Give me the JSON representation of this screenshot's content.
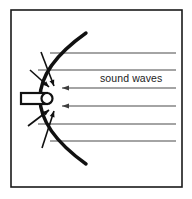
{
  "figure": {
    "background_color": "#ffffff",
    "frame": {
      "name": "outer-frame",
      "x": 11,
      "y": 10,
      "width": 171,
      "height": 177,
      "stroke_color": "#1a1a1a",
      "stroke_width": 1.6,
      "fill": "#ffffff"
    },
    "reflector": {
      "name": "parabolic-reflector",
      "description": "thick parabolic arc opening to the right",
      "vertex_x": 28,
      "vertex_y": 98,
      "top_end_x": 86,
      "top_end_y": 33,
      "bottom_end_x": 86,
      "bottom_end_y": 164,
      "stroke_color": "#111111",
      "stroke_width": 3.4
    },
    "microphone": {
      "name": "microphone-capsule",
      "description": "tube with rounded cap at the parabola focus",
      "tube_x": 21,
      "tube_y": 93,
      "tube_width": 26,
      "tube_height": 11,
      "cap_center_x": 47,
      "cap_center_y": 98.5,
      "cap_radius": 5.5,
      "stroke_color": "#111111",
      "stroke_width": 2.2,
      "fill": "#ffffff"
    },
    "focus": {
      "x": 47,
      "y": 98.5
    },
    "label": {
      "name": "sound-waves-label",
      "text": "sound waves",
      "x": 100,
      "y": 82,
      "color": "#222222",
      "font_size": 10.5
    },
    "wave_lines": {
      "name": "incoming-sound-wave-rays",
      "stroke_color": "#4a4a4a",
      "stroke_width": 1.1,
      "right_x": 176,
      "items": [
        {
          "y": 53,
          "left_x": 50,
          "arrow": false
        },
        {
          "y": 70,
          "left_x": 38,
          "arrow": false
        },
        {
          "y": 88,
          "left_x": 62,
          "arrow": true
        },
        {
          "y": 106,
          "left_x": 62,
          "arrow": true
        },
        {
          "y": 124,
          "left_x": 38,
          "arrow": false
        },
        {
          "y": 141,
          "left_x": 50,
          "arrow": false
        }
      ]
    },
    "focus_arrows": {
      "name": "reflected-ray-arrows",
      "stroke_color": "#111111",
      "stroke_width": 1.6,
      "items": [
        {
          "x1": 41,
          "y1": 52,
          "x2": 54,
          "y2": 86,
          "label": "upper-outer-reflected-ray"
        },
        {
          "x1": 30,
          "y1": 70,
          "x2": 49,
          "y2": 87,
          "label": "upper-inner-reflected-ray"
        },
        {
          "x1": 28,
          "y1": 126,
          "x2": 49,
          "y2": 110,
          "label": "lower-inner-reflected-ray"
        },
        {
          "x1": 42,
          "y1": 148,
          "x2": 54,
          "y2": 111,
          "label": "lower-outer-reflected-ray"
        }
      ],
      "arrow_head_length": 6,
      "arrow_head_width": 5
    },
    "ray_arrow_heads": {
      "name": "wave-line-arrow-heads",
      "head_length": 7,
      "head_width": 5,
      "color": "#3d3d3d"
    }
  }
}
